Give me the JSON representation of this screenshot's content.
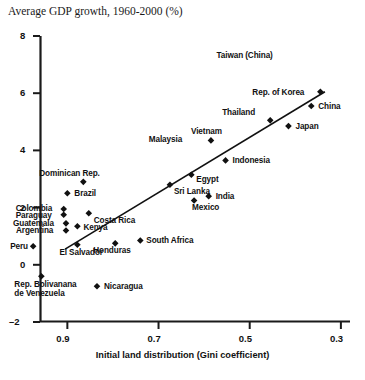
{
  "chart_data": {
    "type": "scatter",
    "title": "Average GDP growth, 1960-2000 (%)",
    "xlabel": "Initial land distribution (Gini coefficient)",
    "ylabel": "Average GDP growth, 1960-2000 (%)",
    "xlim": [
      0.96,
      0.28
    ],
    "ylim": [
      -2,
      8
    ],
    "x_reversed": true,
    "xticks": [
      "0.9",
      "0.7",
      "0.5",
      "0.3"
    ],
    "xtick_values": [
      0.9,
      0.7,
      0.5,
      0.3
    ],
    "yticks": [
      "8",
      "6",
      "4",
      "2",
      "0",
      "–2"
    ],
    "ytick_values": [
      8,
      6,
      4,
      2,
      0,
      -2
    ],
    "grid": false,
    "legend": false,
    "trendline": {
      "x0": 0.905,
      "y0": 0.55,
      "x1": 0.335,
      "y1": 6.05
    },
    "points": [
      {
        "name": "Taiwan (China)",
        "x": 0.45,
        "y": 7.3,
        "label_dx": -56,
        "label_dy": -5,
        "marker": false
      },
      {
        "name": "Rep. of Korea",
        "x": 0.345,
        "y": 6.05,
        "label_dx": -68,
        "label_dy": -4,
        "marker": true
      },
      {
        "name": "China",
        "x": 0.365,
        "y": 5.55,
        "label_dx": 7,
        "label_dy": -4,
        "marker": true
      },
      {
        "name": "Thailand",
        "x": 0.455,
        "y": 5.05,
        "label_dx": -48,
        "label_dy": -12,
        "marker": true
      },
      {
        "name": "Japan",
        "x": 0.415,
        "y": 4.85,
        "label_dx": 7,
        "label_dy": -4,
        "marker": true
      },
      {
        "name": "Vietnam",
        "x": 0.585,
        "y": 4.35,
        "label_dx": -20,
        "label_dy": -13,
        "marker": true
      },
      {
        "name": "Malaysia",
        "x": 0.66,
        "y": 4.4,
        "label_dx": -28,
        "label_dy": -4,
        "marker": false
      },
      {
        "name": "Indonesia",
        "x": 0.553,
        "y": 3.65,
        "label_dx": 7,
        "label_dy": -4,
        "marker": true
      },
      {
        "name": "Egypt",
        "x": 0.628,
        "y": 3.15,
        "label_dx": 5,
        "label_dy": 0,
        "marker": true
      },
      {
        "name": "Sri Lanka",
        "x": 0.675,
        "y": 2.8,
        "label_dx": 4,
        "label_dy": 2,
        "marker": true
      },
      {
        "name": "India",
        "x": 0.59,
        "y": 2.4,
        "label_dx": 7,
        "label_dy": -4,
        "marker": true
      },
      {
        "name": "Mexico",
        "x": 0.622,
        "y": 2.25,
        "label_dx": -2,
        "label_dy": 3,
        "marker": true
      },
      {
        "name": "Dominican Rep.",
        "x": 0.865,
        "y": 2.9,
        "label_dx": -44,
        "label_dy": -13,
        "marker": true
      },
      {
        "name": "Brazil",
        "x": 0.9,
        "y": 2.5,
        "label_dx": 7,
        "label_dy": -4,
        "marker": true
      },
      {
        "name": "Costa Rica",
        "x": 0.853,
        "y": 1.8,
        "label_dx": 5,
        "label_dy": 3,
        "marker": true
      },
      {
        "name": "Colombia",
        "x": 0.908,
        "y": 1.95,
        "label_dx": -48,
        "label_dy": -5,
        "marker": true
      },
      {
        "name": "Paraguay",
        "x": 0.908,
        "y": 1.75,
        "label_dx": -48,
        "label_dy": -4,
        "marker": true
      },
      {
        "name": "Guatemala",
        "x": 0.903,
        "y": 1.45,
        "label_dx": -53,
        "label_dy": -4,
        "marker": true
      },
      {
        "name": "Argentina",
        "x": 0.903,
        "y": 1.2,
        "label_dx": -50,
        "label_dy": -4,
        "marker": true
      },
      {
        "name": "Kenya",
        "x": 0.878,
        "y": 1.35,
        "label_dx": 6,
        "label_dy": -3,
        "marker": true
      },
      {
        "name": "Peru",
        "x": 0.975,
        "y": 0.65,
        "label_dx": -23,
        "label_dy": -4,
        "marker": true
      },
      {
        "name": "El Salvador",
        "x": 0.878,
        "y": 0.7,
        "label_dx": -18,
        "label_dy": 3,
        "marker": true
      },
      {
        "name": "Honduras",
        "x": 0.795,
        "y": 0.75,
        "label_dx": -22,
        "label_dy": 3,
        "marker": true
      },
      {
        "name": "South Africa",
        "x": 0.74,
        "y": 0.85,
        "label_dx": 6,
        "label_dy": -4,
        "marker": true
      },
      {
        "name": "Rep. Bolivanana de Venezuela",
        "x": 0.957,
        "y": -0.4,
        "label_dx": -27,
        "label_dy": 4,
        "marker": true,
        "two_line": true
      },
      {
        "name": "Nicaragua",
        "x": 0.835,
        "y": -0.75,
        "label_dx": 7,
        "label_dy": -4,
        "marker": true
      }
    ]
  },
  "axes": {
    "x_axis_title": "Initial land distribution (Gini coefficient)",
    "y_top_value": "8"
  },
  "colors": {
    "axis": "#1a1a1a",
    "marker": "#111111",
    "trendline": "#111111",
    "background": "#ffffff"
  }
}
